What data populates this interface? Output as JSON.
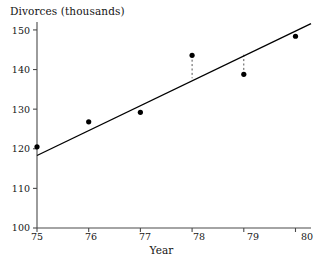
{
  "chart_data": {
    "type": "scatter",
    "title": "",
    "ylabel": "Divorces (thousands)",
    "xlabel": "Year",
    "grid": false,
    "legend": "none",
    "xlim": [
      75,
      80.3
    ],
    "ylim": [
      100,
      152
    ],
    "x_ticks": [
      "75",
      "76",
      "77",
      "78",
      "79",
      "80"
    ],
    "x_tick_values": [
      75,
      76,
      77,
      78,
      79,
      80
    ],
    "y_ticks": [
      "100",
      "110",
      "120",
      "130",
      "140",
      "150"
    ],
    "y_tick_values": [
      100,
      110,
      120,
      130,
      140,
      150
    ],
    "categories": [
      75,
      76,
      77,
      78,
      79,
      80
    ],
    "values": [
      120.5,
      126.8,
      129.2,
      143.6,
      138.8,
      148.4
    ],
    "series": [
      {
        "name": "Divorces",
        "type": "scatter",
        "x": [
          75,
          76,
          77,
          78,
          79,
          80
        ],
        "values": [
          120.5,
          126.8,
          129.2,
          143.6,
          138.8,
          148.4
        ]
      },
      {
        "name": "Least-squares regression line",
        "type": "line",
        "x": [
          75,
          80.3
        ],
        "values": [
          118.3,
          151.6
        ]
      }
    ],
    "annotations": [
      {
        "name": "residual-segment",
        "x": 78,
        "y_point": 143.6,
        "y_line": 137.8,
        "style": "dashed"
      },
      {
        "name": "residual-segment",
        "x": 79,
        "y_point": 138.8,
        "y_line": 144.1,
        "style": "dashed"
      }
    ],
    "colors": {
      "axis": "#4a4a4a",
      "point": "#000000",
      "line": "#000000",
      "residual": "#555555",
      "text": "#141414",
      "background": "#ffffff"
    }
  }
}
